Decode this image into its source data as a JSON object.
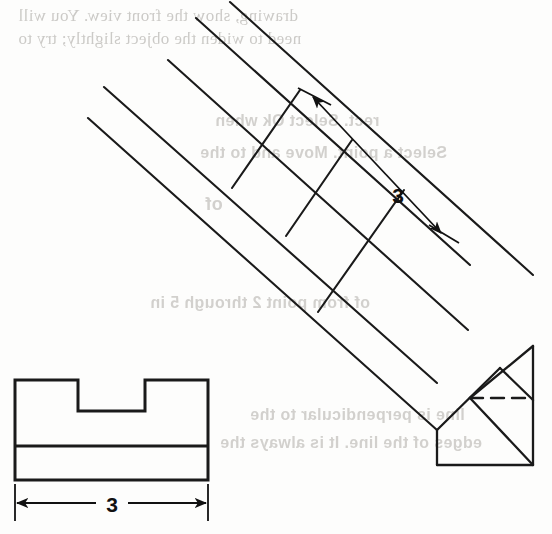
{
  "page": {
    "width": 552,
    "height": 534,
    "background": "#fdfdfc",
    "ink_color": "#1a1a1a",
    "ghost_color": "#b9b7b3"
  },
  "bleed_through_text": [
    {
      "id": "g1",
      "text": "drawing, show the front view.  You will",
      "x": 18,
      "y": 10,
      "size": 17
    },
    {
      "id": "g2",
      "text": "need to widen the object slightly; try to",
      "x": 18,
      "y": 33,
      "size": 17
    },
    {
      "id": "g3",
      "text": "rect.  Select Ok when",
      "x": 215,
      "y": 118,
      "size": 16
    },
    {
      "id": "g4",
      "text": "Select a point. Move and to the",
      "x": 200,
      "y": 150,
      "size": 16
    },
    {
      "id": "g5",
      "text": "of",
      "x": 205,
      "y": 200,
      "size": 17
    },
    {
      "id": "g6",
      "text": "of from point 2 through 5 in",
      "x": 150,
      "y": 300,
      "size": 16
    },
    {
      "id": "g7",
      "text": "line is perpendicular to the",
      "x": 250,
      "y": 412,
      "size": 16
    },
    {
      "id": "g8",
      "text": "edges of the line.  It is always the",
      "x": 220,
      "y": 440,
      "size": 16
    }
  ],
  "drawing": {
    "title": "Pictorial and front view of a notched prism",
    "pictorial_view": {
      "name": "isometric-prism",
      "axis_direction": "down-right",
      "long_edges": [
        {
          "id": "e1",
          "x1": 88,
          "y1": 118,
          "x2": 437,
          "y2": 430
        },
        {
          "id": "e2",
          "x1": 104,
          "y1": 87,
          "x2": 437,
          "y2": 383
        },
        {
          "id": "e3",
          "x1": 168,
          "y1": 60,
          "x2": 468,
          "y2": 330
        },
        {
          "id": "e4",
          "x1": 196,
          "y1": 18,
          "x2": 470,
          "y2": 265
        },
        {
          "id": "e5",
          "x1": 230,
          "y1": 2,
          "x2": 533,
          "y2": 275
        }
      ],
      "cross_lines": [
        {
          "id": "c1",
          "x1": 300,
          "y1": 90,
          "x2": 232,
          "y2": 188
        },
        {
          "id": "c2",
          "x1": 352,
          "y1": 140,
          "x2": 286,
          "y2": 236
        },
        {
          "id": "c3",
          "x1": 404,
          "y1": 190,
          "x2": 318,
          "y2": 312
        }
      ],
      "end_face": {
        "right_edge": {
          "x1": 533,
          "y1": 346,
          "x2": 533,
          "y2": 465
        },
        "bottom_edge": {
          "x1": 437,
          "y1": 465,
          "x2": 533,
          "y2": 465
        },
        "left_edge": {
          "x1": 437,
          "y1": 430,
          "x2": 437,
          "y2": 465
        },
        "chamfer_upper": {
          "x1": 437,
          "y1": 430,
          "x2": 500,
          "y2": 368
        },
        "chamfer_lower": {
          "x1": 470,
          "y1": 398,
          "x2": 533,
          "y2": 346
        },
        "diagonal_front": {
          "x1": 470,
          "y1": 398,
          "x2": 533,
          "y2": 465
        },
        "diagonal_top": {
          "x1": 500,
          "y1": 368,
          "x2": 533,
          "y2": 400
        },
        "hidden_line": {
          "x1": 470,
          "y1": 398,
          "x2": 533,
          "y2": 398,
          "style": "dashed"
        }
      },
      "dimension": {
        "label": "3",
        "label_x": 398,
        "label_y": 203,
        "line": {
          "x1": 312,
          "y1": 96,
          "x2": 440,
          "y2": 232
        },
        "tick_start": {
          "x1": 300,
          "y1": 90,
          "x2": 330,
          "y2": 104
        },
        "tick_end": {
          "x1": 430,
          "y1": 226,
          "x2": 458,
          "y2": 242
        },
        "arrow_start_at": "top-left",
        "arrow_end_at": "bottom-right"
      }
    },
    "front_view": {
      "name": "front-view-notched-block",
      "outline": {
        "left": 15,
        "right": 208,
        "top": 380,
        "bottom": 480
      },
      "notch": {
        "x_start": 78,
        "x_end": 145,
        "depth_y": 411
      },
      "divider_line_y": 446,
      "dimension": {
        "label": "3",
        "label_x": 111,
        "label_y": 510,
        "line_y": 503,
        "x_start": 15,
        "x_end": 208,
        "ext_top_y": 484,
        "ext_bottom_y": 520
      }
    }
  }
}
